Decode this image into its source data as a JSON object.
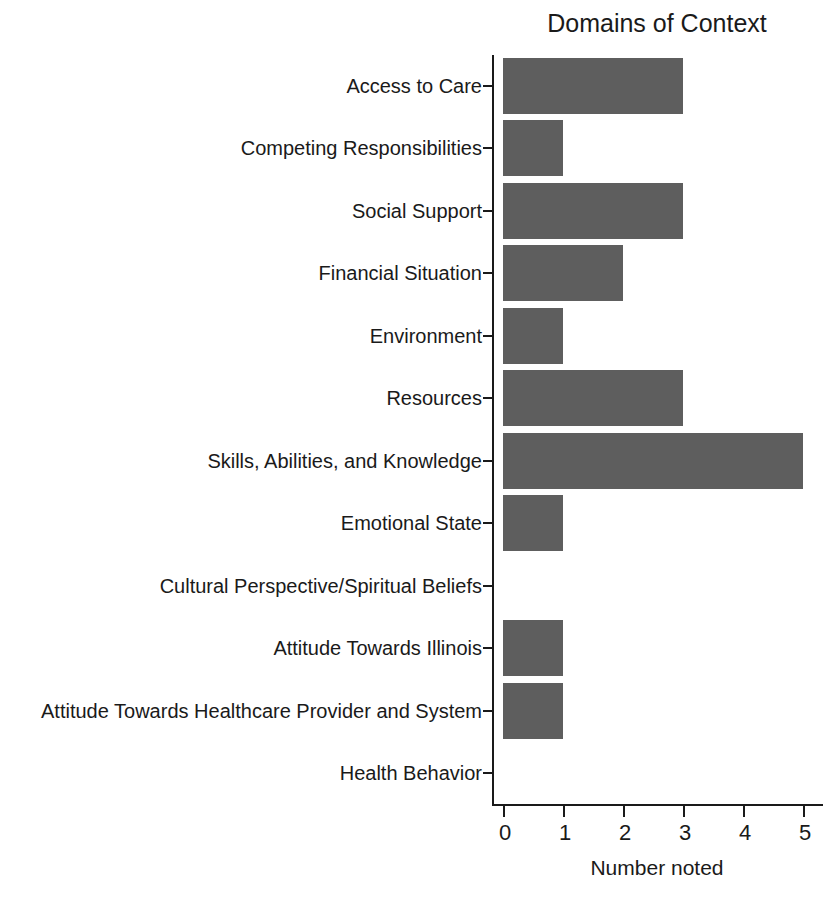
{
  "chart_data": {
    "type": "bar",
    "orientation": "horizontal",
    "title": "Domains of Context",
    "xlabel": "Number noted",
    "ylabel": "",
    "categories": [
      "Access to Care",
      "Competing Responsibilities",
      "Social Support",
      "Financial Situation",
      "Environment",
      "Resources",
      "Skills, Abilities, and Knowledge",
      "Emotional State",
      "Cultural Perspective/Spiritual Beliefs",
      "Attitude Towards Illinois",
      "Attitude Towards Healthcare Provider and System",
      "Health Behavior"
    ],
    "values": [
      3,
      1,
      3,
      2,
      1,
      3,
      5,
      1,
      0,
      1,
      1,
      0
    ],
    "xlim": [
      0,
      5
    ],
    "xticks": [
      0,
      1,
      2,
      3,
      4,
      5
    ],
    "xtick_labels": [
      "0",
      "1",
      "2",
      "3",
      "4",
      "5"
    ],
    "grid": false,
    "legend": false,
    "bar_color": "#5e5e5e",
    "axis_color": "#1a1a1a",
    "background_color": "#ffffff"
  }
}
